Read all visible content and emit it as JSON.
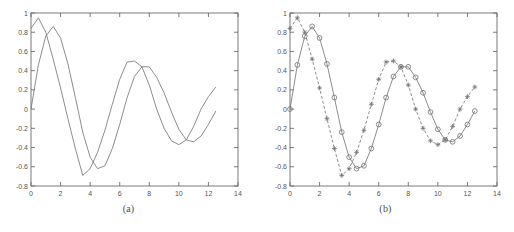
{
  "figure": {
    "type": "two-panel-line-plot",
    "background": "#ffffff",
    "axis_color": "#6b6b6b",
    "curve_color": "#707070",
    "width": 514,
    "height": 232
  },
  "panels": [
    {
      "id": "a",
      "caption": "(a)",
      "chart_data": {
        "type": "line",
        "title": "",
        "xlabel": "",
        "ylabel": "",
        "xlim": [
          0,
          14
        ],
        "ylim": [
          -0.8,
          1
        ],
        "xticks": [
          0,
          2,
          4,
          6,
          8,
          10,
          12,
          14
        ],
        "xticklabels": [
          "0",
          "2",
          "4",
          "6",
          "8",
          "10",
          "12",
          "14"
        ],
        "yticks": [
          -0.8,
          -0.6,
          -0.4,
          -0.2,
          0,
          0.2,
          0.4,
          0.6,
          0.8,
          1
        ],
        "yticklabels": [
          "-0.8",
          "-0.6",
          "-0.4",
          "-0.2",
          "0",
          "0.2",
          "0.4",
          "0.6",
          "0.8",
          "1"
        ],
        "grid": false,
        "legend": null,
        "series": [
          {
            "name": "signal-1",
            "style": "solid",
            "marker": "none",
            "x": [
              0,
              0.5,
              1,
              1.5,
              2,
              2.5,
              3,
              3.5,
              4,
              4.5,
              5,
              5.5,
              6,
              6.5,
              7,
              7.5,
              8,
              8.5,
              9,
              9.5,
              10,
              10.5,
              11,
              11.5,
              12,
              12.5
            ],
            "y": [
              0.84,
              0.95,
              0.8,
              0.52,
              0.22,
              -0.1,
              -0.41,
              -0.69,
              -0.62,
              -0.45,
              -0.22,
              0.05,
              0.31,
              0.49,
              0.5,
              0.44,
              0.25,
              0.0,
              -0.2,
              -0.33,
              -0.37,
              -0.32,
              -0.18,
              0.0,
              0.13,
              0.23
            ]
          },
          {
            "name": "signal-2",
            "style": "solid",
            "marker": "none",
            "x": [
              0,
              0.5,
              1,
              1.5,
              2,
              2.5,
              3,
              3.5,
              4,
              4.5,
              5,
              5.5,
              6,
              6.5,
              7,
              7.5,
              8,
              8.5,
              9,
              9.5,
              10,
              10.5,
              11,
              11.5,
              12,
              12.5
            ],
            "y": [
              0.0,
              0.46,
              0.76,
              0.86,
              0.74,
              0.47,
              0.12,
              -0.24,
              -0.5,
              -0.62,
              -0.59,
              -0.41,
              -0.16,
              0.12,
              0.34,
              0.44,
              0.44,
              0.33,
              0.17,
              -0.03,
              -0.21,
              -0.32,
              -0.34,
              -0.28,
              -0.16,
              -0.02
            ]
          }
        ]
      }
    },
    {
      "id": "b",
      "caption": "(b)",
      "chart_data": {
        "type": "line",
        "title": "",
        "xlabel": "",
        "ylabel": "",
        "xlim": [
          0,
          14
        ],
        "ylim": [
          -0.8,
          1
        ],
        "xticks": [
          0,
          2,
          4,
          6,
          8,
          10,
          12,
          14
        ],
        "xticklabels": [
          "0",
          "2",
          "4",
          "6",
          "8",
          "10",
          "12",
          "14"
        ],
        "yticks": [
          -0.8,
          -0.6,
          -0.4,
          -0.2,
          0,
          0.2,
          0.4,
          0.6,
          0.8,
          1
        ],
        "yticklabels": [
          "-0.8",
          "-0.6",
          "-0.4",
          "-0.2",
          "0",
          "0.2",
          "0.4",
          "0.6",
          "0.8",
          "1"
        ],
        "grid": false,
        "legend": null,
        "series": [
          {
            "name": "sampled-signal-1",
            "style": "dashed",
            "marker": "plus",
            "x": [
              0,
              0.5,
              1,
              1.5,
              2,
              2.5,
              3,
              3.5,
              4,
              4.5,
              5,
              5.5,
              6,
              6.5,
              7,
              7.5,
              8,
              8.5,
              9,
              9.5,
              10,
              10.5,
              11,
              11.5,
              12,
              12.5
            ],
            "y": [
              0.84,
              0.95,
              0.8,
              0.52,
              0.22,
              -0.1,
              -0.41,
              -0.69,
              -0.62,
              -0.45,
              -0.22,
              0.05,
              0.31,
              0.49,
              0.5,
              0.44,
              0.25,
              0.0,
              -0.2,
              -0.33,
              -0.37,
              -0.32,
              -0.18,
              0.0,
              0.13,
              0.23
            ]
          },
          {
            "name": "sampled-signal-2",
            "style": "solid",
            "marker": "circle",
            "x": [
              0,
              0.5,
              1,
              1.5,
              2,
              2.5,
              3,
              3.5,
              4,
              4.5,
              5,
              5.5,
              6,
              6.5,
              7,
              7.5,
              8,
              8.5,
              9,
              9.5,
              10,
              10.5,
              11,
              11.5,
              12,
              12.5
            ],
            "y": [
              0.0,
              0.46,
              0.76,
              0.86,
              0.74,
              0.47,
              0.12,
              -0.24,
              -0.5,
              -0.62,
              -0.59,
              -0.41,
              -0.16,
              0.12,
              0.34,
              0.44,
              0.44,
              0.33,
              0.17,
              -0.03,
              -0.21,
              -0.32,
              -0.34,
              -0.28,
              -0.16,
              -0.02
            ]
          }
        ]
      }
    }
  ]
}
